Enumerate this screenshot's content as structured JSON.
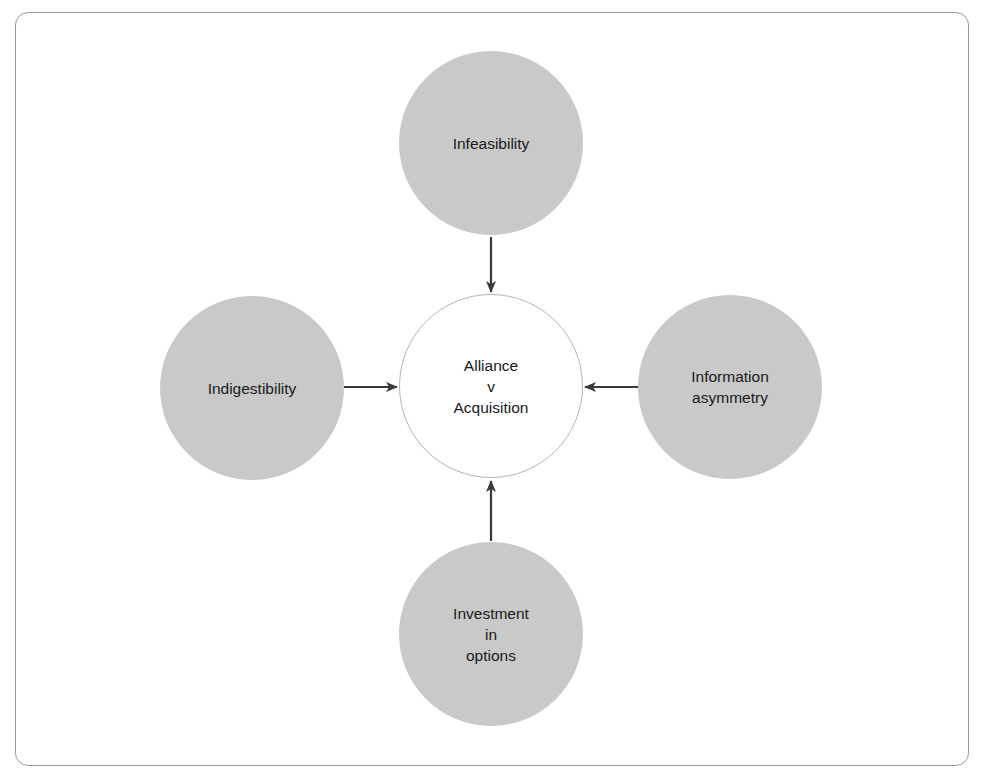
{
  "diagram": {
    "type": "radial-influence",
    "center": {
      "lines": [
        "Alliance",
        "v",
        "Acquisition"
      ]
    },
    "factors": [
      {
        "position": "top",
        "lines": [
          "Infeasibility"
        ]
      },
      {
        "position": "left",
        "lines": [
          "Indigestibility"
        ]
      },
      {
        "position": "right",
        "lines": [
          "Information",
          "asymmetry"
        ]
      },
      {
        "position": "bottom",
        "lines": [
          "Investment",
          "in",
          "options"
        ]
      }
    ],
    "edges": [
      {
        "from": "Infeasibility",
        "to": "Alliance v Acquisition"
      },
      {
        "from": "Indigestibility",
        "to": "Alliance v Acquisition"
      },
      {
        "from": "Information asymmetry",
        "to": "Alliance v Acquisition"
      },
      {
        "from": "Investment in options",
        "to": "Alliance v Acquisition"
      }
    ],
    "colors": {
      "factor_fill": "#c9c9c9",
      "center_fill": "#ffffff",
      "center_stroke": "#b5b5b5",
      "arrow": "#3a3a3a",
      "frame": "#9a9a9a",
      "text": "#1a1a1a"
    }
  }
}
